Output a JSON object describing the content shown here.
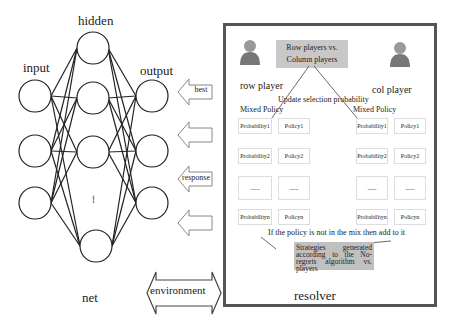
{
  "network": {
    "labels": {
      "input": "input",
      "hidden": "hidden",
      "output": "output",
      "net": "net",
      "ellipsis": "......"
    }
  },
  "arrows": [
    {
      "label": "best"
    },
    {
      "label": ""
    },
    {
      "label": "response"
    },
    {
      "label": ""
    }
  ],
  "environment": {
    "label": "environment"
  },
  "resolver": {
    "label": "resolver",
    "title": "Row players vs. Column players",
    "title_line1": "Row players vs.",
    "title_line2": "Column players",
    "row_player": "row player",
    "col_player": "col player",
    "update_text": "Update selection probability",
    "mixed_policy_left": "Mixed Policy",
    "mixed_policy_right": "Mixed Policy",
    "left_table": [
      {
        "prob": "Probability1",
        "policy": "Policy1"
      },
      {
        "prob": "Probability2",
        "policy": "Policy2"
      },
      {
        "prob": "......",
        "policy": "......"
      },
      {
        "prob": "Probabilityn",
        "policy": "Policyn"
      }
    ],
    "right_table": [
      {
        "prob": "Probability1",
        "policy": "Policy1"
      },
      {
        "prob": "Probability2",
        "policy": "Policy2"
      },
      {
        "prob": "......",
        "policy": "......"
      },
      {
        "prob": "Probabilityn",
        "policy": "Policyn"
      }
    ],
    "mix_text": "If the policy is not in the mix then add to it",
    "strategies_text": "Strategies generated according to the No-regrets algorithm vs. players"
  },
  "colors": {
    "stroke": "#222222",
    "box_border": "#555555",
    "title_fill": "#c8c8c8",
    "strat_fill": "#c0c0c0"
  }
}
